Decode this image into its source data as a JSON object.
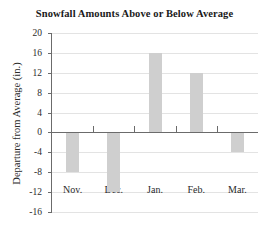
{
  "chart_data": {
    "type": "bar",
    "title": "Snowfall Amounts Above or Below Average",
    "xlabel": "",
    "ylabel": "Departure from Average (in.)",
    "categories": [
      "Nov.",
      "Dec.",
      "Jan.",
      "Feb.",
      "Mar."
    ],
    "values": [
      -8,
      -12,
      16,
      12,
      -4
    ],
    "ylim": [
      -16,
      20
    ],
    "ytick_step": 4,
    "yticks": [
      20,
      16,
      12,
      8,
      4,
      0,
      -4,
      -8,
      -12,
      -16
    ],
    "ytick_labels": [
      "20",
      "16",
      "12",
      "8",
      "4",
      "0",
      "-4",
      "-8",
      "-12",
      "-16"
    ],
    "grid": true,
    "legend": false,
    "bar_color": "#cfcfcf",
    "axis_color": "#6b6b6b",
    "grid_color": "#e3e3e3",
    "zero_line": 0
  }
}
